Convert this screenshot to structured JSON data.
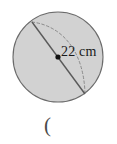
{
  "figure": {
    "kind": "sphere-diagram",
    "background_color": "#ffffff",
    "circle": {
      "fill_color": "#d2d2d2",
      "stroke_color": "#6b6b6b",
      "center_x": 58,
      "center_y": 57,
      "radius": 45
    },
    "diameter_line": {
      "stroke_color": "#5a5a5a",
      "x1": 32,
      "y1": 22,
      "x2": 85,
      "y2": 94,
      "style": "solid"
    },
    "equator_arc": {
      "stroke_color": "#8a8a8a",
      "style": "dashed",
      "x1": 32,
      "y1": 22,
      "x2": 85,
      "y2": 94
    },
    "center_point": {
      "color": "#111111",
      "x": 58,
      "y": 57,
      "radius": 2.6
    },
    "dimension_label": "22 cm",
    "stray_mark": "("
  }
}
